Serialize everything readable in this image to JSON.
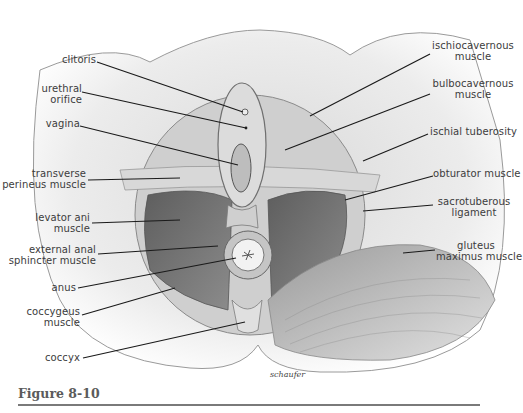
{
  "figure": {
    "caption": "Figure 8-10",
    "signature": "schaufer",
    "labels_left": [
      {
        "id": "clitoris",
        "text": "clitoris"
      },
      {
        "id": "urethral-orifice",
        "text": "urethral\norifice"
      },
      {
        "id": "vagina",
        "text": "vagina"
      },
      {
        "id": "transverse-perineus",
        "text": "transverse\nperineus muscle"
      },
      {
        "id": "levator-ani",
        "text": "levator ani\nmuscle"
      },
      {
        "id": "external-anal-sphincter",
        "text": "external anal\nsphincter muscle"
      },
      {
        "id": "anus",
        "text": "anus"
      },
      {
        "id": "coccygeus",
        "text": "coccygeus\nmuscle"
      },
      {
        "id": "coccyx",
        "text": "coccyx"
      }
    ],
    "labels_right": [
      {
        "id": "ischiocavernous",
        "text": "ischiocavernous\nmuscle"
      },
      {
        "id": "bulbocavernous",
        "text": "bulbocavernous\nmuscle"
      },
      {
        "id": "ischial-tuberosity",
        "text": "ischial tuberosity"
      },
      {
        "id": "obturator",
        "text": "obturator muscle"
      },
      {
        "id": "sacrotuberous",
        "text": "sacrotuberous\nligament"
      },
      {
        "id": "gluteus-maximus",
        "text": "gluteus\nmaximus muscle"
      }
    ],
    "colors": {
      "skin": "#e9e9e9",
      "muscle_light": "#c8c8c8",
      "muscle_dark": "#6e6e6e",
      "leader_line": "#1a1a1a",
      "label_text": "#3c3c3c",
      "caption_text": "#5b5b5b",
      "caption_rule": "#7a7a7a"
    }
  }
}
